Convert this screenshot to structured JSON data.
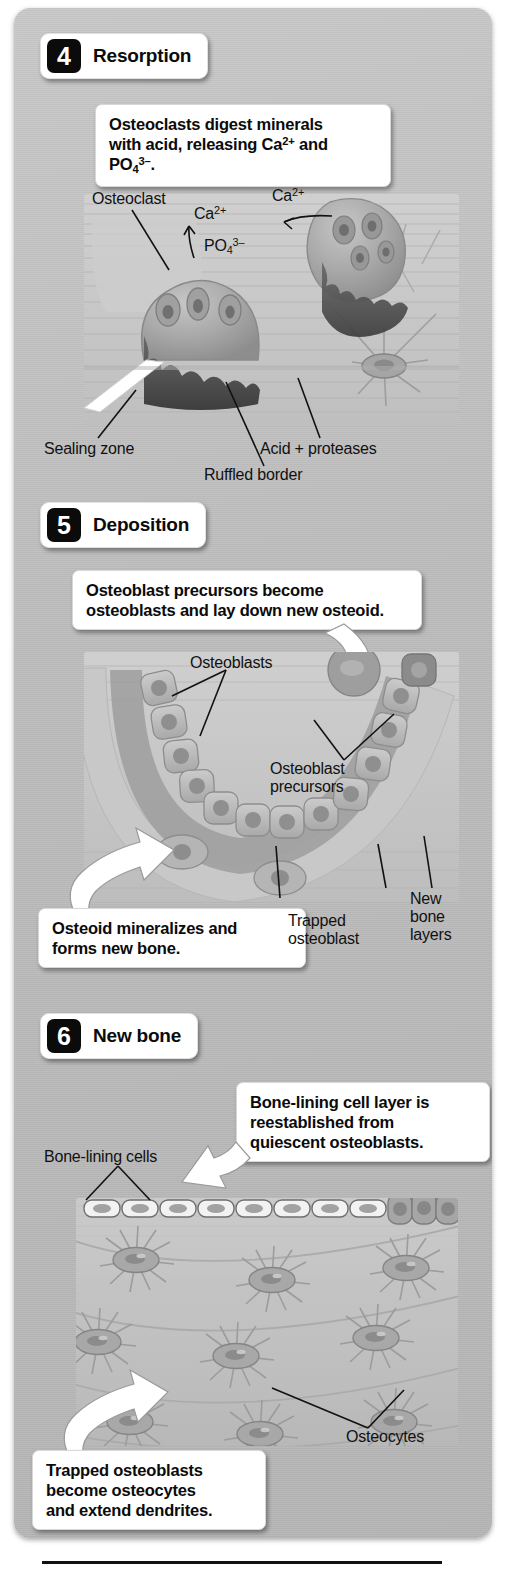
{
  "figure": {
    "kind": "bone-remodeling-stages",
    "background_color": "#bdbdbd",
    "accent_color": "#0b0b0b"
  },
  "steps": [
    {
      "number": "4",
      "title": "Resorption",
      "callout": "Osteoclasts digest minerals with acid, releasing Ca2+ and PO43-.",
      "callout_line1": "Osteoclasts digest minerals",
      "callout_line2_a": "with acid, releasing Ca",
      "callout_line2_sup1": "2+",
      "callout_line2_b": " and PO",
      "callout_line2_sub": "4",
      "callout_line2_sup2": "3–",
      "callout_line2_c": ".",
      "labels": {
        "osteoclast": "Osteoclast",
        "calcium_left": "Ca",
        "calcium_left_sup": "2+",
        "calcium_right": "Ca",
        "calcium_right_sup": "2+",
        "phosphate": "PO",
        "phosphate_sub": "4",
        "phosphate_sup": "3–",
        "sealing_zone": "Sealing zone",
        "ruffled_border": "Ruffled border",
        "acid_proteases": "Acid + proteases"
      }
    },
    {
      "number": "5",
      "title": "Deposition",
      "callout": "Osteoblast precursors become osteoblasts and lay down new osteoid.",
      "callout_line1": "Osteoblast precursors become",
      "callout_line2": "osteoblasts and lay down new osteoid.",
      "callout2": "Osteoid mineralizes and forms new bone.",
      "callout2_line1": "Osteoid mineralizes and",
      "callout2_line2": "forms new bone.",
      "labels": {
        "osteoblasts": "Osteoblasts",
        "osteoblast_precursors_line1": "Osteoblast",
        "osteoblast_precursors_line2": "precursors",
        "trapped_osteoblast_line1": "Trapped",
        "trapped_osteoblast_line2": "osteoblast",
        "new_bone_layers_line1": "New",
        "new_bone_layers_line2": "bone",
        "new_bone_layers_line3": "layers"
      }
    },
    {
      "number": "6",
      "title": "New bone",
      "callout": "Bone-lining cell layer is reestablished from quiescent osteoblasts.",
      "callout_line1": "Bone-lining cell layer is",
      "callout_line2": "reestablished from",
      "callout_line3": "quiescent osteoblasts.",
      "callout2": "Trapped osteoblasts become osteocytes and extend dendrites.",
      "callout2_line1": "Trapped osteoblasts",
      "callout2_line2": "become osteocytes",
      "callout2_line3": "and extend dendrites.",
      "labels": {
        "bone_lining_cells": "Bone-lining cells",
        "osteocytes": "Osteocytes"
      }
    }
  ]
}
